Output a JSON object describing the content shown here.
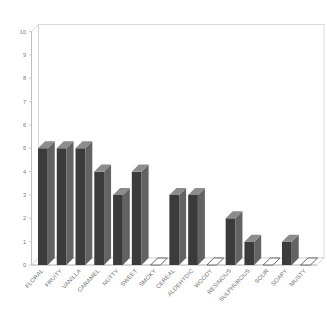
{
  "chart_data": {
    "type": "bar",
    "title": "",
    "subtitle": "",
    "xlabel": "",
    "ylabel": "",
    "ylim": [
      0,
      10
    ],
    "yticks": [
      "0",
      "1",
      "2",
      "3",
      "4",
      "5",
      "6",
      "7",
      "8",
      "9",
      "10"
    ],
    "grid": false,
    "legend": "none",
    "style": "3d-column",
    "bar_color": "#3b3b3b",
    "bar_side_color": "#636363",
    "bar_top_color": "#8c8c8c",
    "axis_color": "#b9b9b9",
    "label_color": "#6f6f6f",
    "background": "#ffffff",
    "categories": [
      "FLORAL",
      "FRUITY",
      "VANILLA",
      "CARAMEL",
      "NUTTY",
      "SWEET",
      "SMOKY",
      "CEREAL",
      "ALDEHYDIC",
      "WOODY",
      "RESINOUS",
      "SULPHUROUS",
      "SOUR",
      "SOAPY",
      "MUSTY"
    ],
    "values": [
      5,
      5,
      5,
      4,
      3,
      4,
      0,
      3,
      3,
      0,
      2,
      1,
      0,
      1,
      0
    ]
  }
}
